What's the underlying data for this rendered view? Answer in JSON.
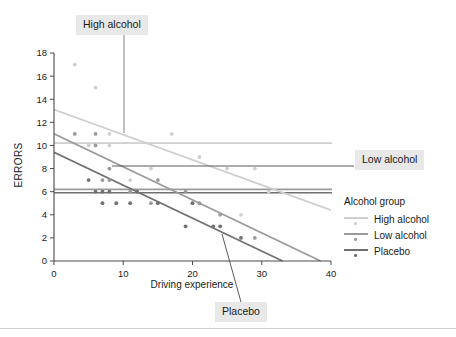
{
  "chart_data": {
    "type": "scatter",
    "title": "",
    "xlabel": "Driving experience",
    "ylabel": "ERRORS",
    "xlim": [
      0,
      40
    ],
    "ylim": [
      0,
      18
    ],
    "xticks": [
      0,
      10,
      20,
      30,
      40
    ],
    "yticks": [
      0,
      2,
      4,
      6,
      8,
      10,
      12,
      14,
      16,
      18
    ],
    "grid": false,
    "legend_position": "right",
    "legend_title": "Alcohol group",
    "series": [
      {
        "name": "High alcohol",
        "color": "#cfcfcf",
        "points": [
          {
            "x": 3,
            "y": 17
          },
          {
            "x": 6,
            "y": 15
          },
          {
            "x": 8,
            "y": 11
          },
          {
            "x": 5,
            "y": 10
          },
          {
            "x": 8,
            "y": 10
          },
          {
            "x": 11,
            "y": 7
          },
          {
            "x": 14,
            "y": 8
          },
          {
            "x": 17,
            "y": 11
          },
          {
            "x": 21,
            "y": 9
          },
          {
            "x": 20,
            "y": 5
          },
          {
            "x": 25,
            "y": 8
          },
          {
            "x": 29,
            "y": 8
          },
          {
            "x": 27,
            "y": 4
          },
          {
            "x": 31,
            "y": 6
          }
        ],
        "fit_line": {
          "x0": 0,
          "y0": 13.1,
          "x1": 40,
          "y1": 4.4
        }
      },
      {
        "name": "Low alcohol",
        "color": "#9a9a9a",
        "points": [
          {
            "x": 3,
            "y": 11
          },
          {
            "x": 6,
            "y": 11
          },
          {
            "x": 6,
            "y": 10
          },
          {
            "x": 8,
            "y": 8
          },
          {
            "x": 7,
            "y": 7
          },
          {
            "x": 8,
            "y": 7
          },
          {
            "x": 11,
            "y": 6
          },
          {
            "x": 12,
            "y": 6
          },
          {
            "x": 15,
            "y": 7
          },
          {
            "x": 14,
            "y": 5
          },
          {
            "x": 19,
            "y": 6
          },
          {
            "x": 21,
            "y": 5
          },
          {
            "x": 24,
            "y": 4
          },
          {
            "x": 29,
            "y": 2
          }
        ],
        "fit_line": {
          "x0": 0,
          "y0": 11.0,
          "x1": 38.5,
          "y1": 0
        }
      },
      {
        "name": "Placebo",
        "color": "#707070",
        "points": [
          {
            "x": 5,
            "y": 7
          },
          {
            "x": 6,
            "y": 6
          },
          {
            "x": 7,
            "y": 6
          },
          {
            "x": 8,
            "y": 6
          },
          {
            "x": 7,
            "y": 5
          },
          {
            "x": 9,
            "y": 5
          },
          {
            "x": 11,
            "y": 5
          },
          {
            "x": 12,
            "y": 6
          },
          {
            "x": 15,
            "y": 5
          },
          {
            "x": 19,
            "y": 3
          },
          {
            "x": 20,
            "y": 5
          },
          {
            "x": 23,
            "y": 3
          },
          {
            "x": 24,
            "y": 3
          },
          {
            "x": 27,
            "y": 2
          }
        ],
        "fit_line": {
          "x0": 0,
          "y0": 9.4,
          "x1": 33,
          "y1": 0
        }
      }
    ],
    "reference_lines": [
      {
        "name": "high-alcohol-mean",
        "y": 10.2,
        "color": "#cfcfcf"
      },
      {
        "name": "low-alcohol-mean",
        "y": 6.2,
        "color": "#9a9a9a"
      },
      {
        "name": "placebo-mean",
        "y": 5.9,
        "color": "#707070"
      }
    ],
    "annotations": [
      {
        "name": "high-alcohol",
        "label": "High alcohol",
        "leader": "vertical"
      },
      {
        "name": "low-alcohol",
        "label": "Low alcohol",
        "leader": "horizontal"
      },
      {
        "name": "placebo",
        "label": "Placebo",
        "leader": "diagonal"
      }
    ]
  },
  "legend": {
    "title": "Alcohol group",
    "items": [
      {
        "label": "High alcohol"
      },
      {
        "label": "Low alcohol"
      },
      {
        "label": "Placebo"
      }
    ]
  },
  "axes": {
    "x_label": "Driving experience",
    "y_label": "ERRORS",
    "x_ticks": [
      "0",
      "10",
      "20",
      "30",
      "40"
    ],
    "y_ticks": [
      "0",
      "2",
      "4",
      "6",
      "8",
      "10",
      "12",
      "14",
      "16",
      "18"
    ]
  },
  "callouts": {
    "high_alcohol": "High alcohol",
    "low_alcohol": "Low alcohol",
    "placebo": "Placebo"
  },
  "colors": {
    "high": "#cfcfcf",
    "low": "#9a9a9a",
    "placebo": "#707070",
    "axis": "#4a4a4a",
    "text": "#1a1a1a",
    "callout_bg": "#e8e8e8"
  }
}
